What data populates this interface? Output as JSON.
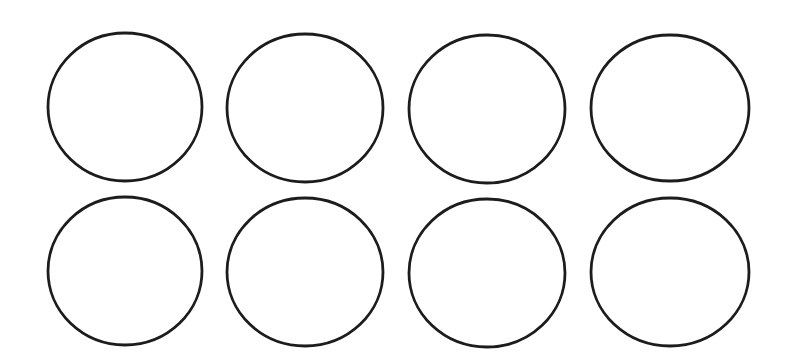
{
  "canvas": {
    "width": 790,
    "height": 364,
    "background": "#ffffff"
  },
  "style": {
    "stroke": "#1c1c1c",
    "stroke_width": 2.8,
    "fill": "none"
  },
  "grid": {
    "rows": 2,
    "cols": 4
  },
  "circles": [
    {
      "row": 1,
      "col": 1,
      "cx": 125,
      "cy": 107,
      "rx": 77,
      "ry": 74
    },
    {
      "row": 1,
      "col": 2,
      "cx": 305,
      "cy": 108,
      "rx": 78,
      "ry": 74
    },
    {
      "row": 1,
      "col": 3,
      "cx": 487,
      "cy": 109,
      "rx": 78,
      "ry": 74
    },
    {
      "row": 1,
      "col": 4,
      "cx": 670,
      "cy": 108,
      "rx": 79,
      "ry": 73
    },
    {
      "row": 2,
      "col": 1,
      "cx": 125,
      "cy": 271,
      "rx": 77,
      "ry": 74
    },
    {
      "row": 2,
      "col": 2,
      "cx": 305,
      "cy": 272,
      "rx": 78,
      "ry": 74
    },
    {
      "row": 2,
      "col": 3,
      "cx": 487,
      "cy": 273,
      "rx": 78,
      "ry": 74
    },
    {
      "row": 2,
      "col": 4,
      "cx": 670,
      "cy": 272,
      "rx": 79,
      "ry": 74
    }
  ]
}
